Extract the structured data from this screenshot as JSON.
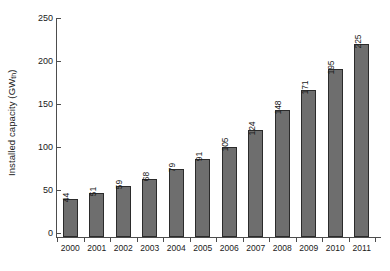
{
  "chart_data": {
    "type": "bar",
    "title": "",
    "xlabel": "",
    "ylabel": "Installed capacity (GWth)",
    "ylabel_main": "Installed capacity (GW",
    "ylabel_sub": "th",
    "ylabel_tail": ")",
    "categories": [
      "2000",
      "2001",
      "2002",
      "2003",
      "2004",
      "2005",
      "2006",
      "2007",
      "2008",
      "2009",
      "2010",
      "2011"
    ],
    "values": [
      44,
      51,
      59,
      68,
      79,
      91,
      105,
      124,
      148,
      171,
      195,
      225
    ],
    "value_labels": [
      "44",
      "51",
      "59",
      "68",
      "79",
      "91",
      "105",
      "124",
      "148",
      "171",
      "195",
      "225"
    ],
    "ylim": [
      0,
      250
    ],
    "yticks": [
      0,
      50,
      100,
      150,
      200,
      250
    ],
    "ytick_labels": [
      "0",
      "50",
      "100",
      "150",
      "200",
      "250"
    ],
    "grid": false,
    "legend": "none",
    "bar_fill_color": "#6e6e6e",
    "bar_edge_color": "#2b2b2b",
    "axis_color": "#4d4d4d",
    "background_color": "#ffffff",
    "value_label_rotation": -90,
    "frame": "left-and-bottom-only"
  }
}
